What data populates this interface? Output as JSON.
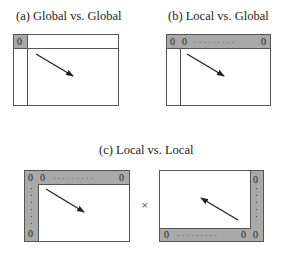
{
  "panels": {
    "a": {
      "title": "(a) Global vs. Global",
      "corner_label": "0"
    },
    "b": {
      "title": "(b) Local vs. Global",
      "labels": [
        "0",
        "0",
        "0"
      ]
    },
    "c": {
      "title": "(c) Local vs. Local",
      "left": {
        "labels": [
          "0",
          "0",
          "0",
          "0"
        ]
      },
      "right": {
        "labels": [
          "0",
          "0",
          "0",
          "0"
        ]
      },
      "operator": "×"
    }
  },
  "colors": {
    "shade": "#a9a9a9",
    "border": "#555555",
    "arrow": "#222222"
  }
}
